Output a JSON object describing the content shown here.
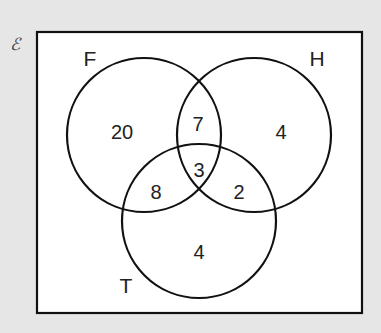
{
  "diagram": {
    "type": "venn-3-set",
    "universal_symbol": "ℰ",
    "sets": [
      {
        "name": "F",
        "cx": 144,
        "cy": 135,
        "r": 77,
        "label_x": 90,
        "label_y": 66
      },
      {
        "name": "H",
        "cx": 254,
        "cy": 135,
        "r": 77,
        "label_x": 317,
        "label_y": 66
      },
      {
        "name": "T",
        "cx": 199,
        "cy": 221,
        "r": 77,
        "label_x": 126,
        "label_y": 293
      }
    ],
    "regions": [
      {
        "id": "F-only",
        "value": "20",
        "x": 122,
        "y": 134
      },
      {
        "id": "F-H-only",
        "value": "7",
        "x": 198,
        "y": 126
      },
      {
        "id": "H-only",
        "value": "4",
        "x": 281,
        "y": 134
      },
      {
        "id": "F-H-T",
        "value": "3",
        "x": 199,
        "y": 172
      },
      {
        "id": "F-T-only",
        "value": "8",
        "x": 156,
        "y": 194
      },
      {
        "id": "H-T-only",
        "value": "2",
        "x": 239,
        "y": 194
      },
      {
        "id": "T-only",
        "value": "4",
        "x": 199,
        "y": 254
      }
    ],
    "outside_value": null
  },
  "colors": {
    "background": "#e6e6e6",
    "box_fill": "#ffffff",
    "stroke": "#111111"
  }
}
